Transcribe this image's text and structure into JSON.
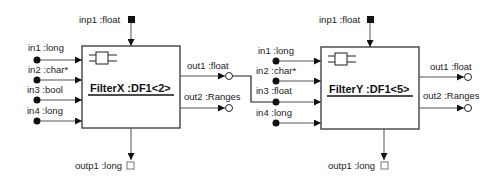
{
  "diagram": {
    "blocks": [
      {
        "name": "FilterX :DF1<2>",
        "top_input": "inp1 :float",
        "bottom_output": "outp1 :long",
        "inputs": [
          "in1 :long",
          "in2 :char*",
          "in3 :bool",
          "in4 :long"
        ],
        "outputs": [
          "out1 :float",
          "out2 :Ranges"
        ]
      },
      {
        "name": "FilterY :DF1<5>",
        "top_input": "inp1 :float",
        "bottom_output": "outp1 :long",
        "inputs": [
          "in1 :long",
          "in2 :char*",
          "in3 :float",
          "in4 :long"
        ],
        "outputs": [
          "out1 :float",
          "out2 :Ranges"
        ]
      }
    ],
    "connections": [
      {
        "from": "FilterX.out1",
        "to": "FilterY.in3"
      }
    ],
    "colors": {
      "stroke": "#222222",
      "background": "#ffffff"
    }
  }
}
